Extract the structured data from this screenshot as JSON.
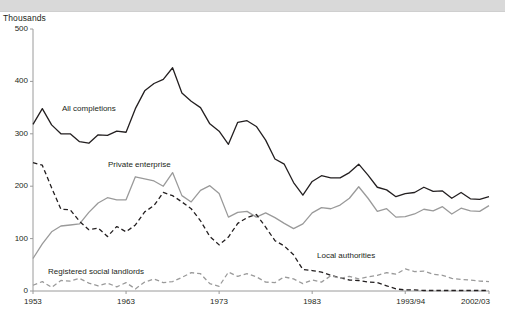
{
  "header": {
    "title": ""
  },
  "axis": {
    "unit_label": "Thousands",
    "y_ticks": [
      "500",
      "400",
      "300",
      "200",
      "100",
      "0"
    ],
    "x_ticks": [
      "1953",
      "1963",
      "1973",
      "1983",
      "1993/94",
      "2002/03"
    ]
  },
  "labels": {
    "all_completions": "All completions",
    "private_enterprise": "Private enterprise",
    "local_authorities": "Local authorities",
    "registered_social_landlords": "Registered social landlords"
  },
  "colors": {
    "all_completions": "#231f20",
    "private_enterprise": "#9a9a9a",
    "local_authorities": "#231f20",
    "registered_social_landlords": "#9a9a9a",
    "axis": "#9a9a9a",
    "header_bar": "#d9d9d9"
  },
  "chart_data": {
    "type": "line",
    "title": "",
    "xlabel": "",
    "ylabel": "Thousands",
    "ylim": [
      0,
      500
    ],
    "xlim": [
      1953,
      2002
    ],
    "grid": false,
    "legend": "inline-annotations",
    "x": [
      1953,
      1954,
      1955,
      1956,
      1957,
      1958,
      1959,
      1960,
      1961,
      1962,
      1963,
      1964,
      1965,
      1966,
      1967,
      1968,
      1969,
      1970,
      1971,
      1972,
      1973,
      1974,
      1975,
      1976,
      1977,
      1978,
      1979,
      1980,
      1981,
      1982,
      1983,
      1984,
      1985,
      1986,
      1987,
      1988,
      1989,
      1990,
      1991,
      1992,
      1993,
      1994,
      1995,
      1996,
      1997,
      1998,
      1999,
      2000,
      2001,
      2002
    ],
    "x_tick_labels": {
      "1953": "1953",
      "1963": "1963",
      "1973": "1973",
      "1983": "1983",
      "1993": "1993/94",
      "2002": "2002/03"
    },
    "series": [
      {
        "name": "All completions",
        "style": "solid",
        "color": "#231f20",
        "values": [
          318,
          348,
          317,
          300,
          300,
          285,
          282,
          298,
          297,
          305,
          303,
          348,
          382,
          396,
          404,
          426,
          378,
          362,
          350,
          319,
          305,
          280,
          322,
          325,
          314,
          288,
          252,
          242,
          207,
          183,
          209,
          220,
          216,
          216,
          226,
          242,
          221,
          198,
          193,
          180,
          186,
          188,
          198,
          190,
          191,
          177,
          188,
          176,
          175,
          180
        ]
      },
      {
        "name": "Private enterprise",
        "style": "solid",
        "color": "#9a9a9a",
        "values": [
          62,
          90,
          113,
          124,
          126,
          128,
          150,
          168,
          178,
          174,
          174,
          218,
          214,
          210,
          200,
          226,
          182,
          170,
          192,
          201,
          186,
          141,
          150,
          152,
          141,
          149,
          140,
          129,
          119,
          128,
          149,
          159,
          157,
          164,
          177,
          199,
          177,
          152,
          157,
          141,
          142,
          147,
          156,
          153,
          161,
          147,
          158,
          153,
          152,
          163
        ]
      },
      {
        "name": "Local authorities",
        "style": "dashed",
        "color": "#231f20",
        "values": [
          245,
          240,
          197,
          156,
          155,
          133,
          117,
          120,
          104,
          123,
          113,
          126,
          151,
          163,
          188,
          182,
          170,
          157,
          134,
          104,
          88,
          103,
          129,
          140,
          146,
          122,
          96,
          86,
          69,
          41,
          39,
          36,
          30,
          25,
          21,
          20,
          17,
          16,
          10,
          4,
          2,
          2,
          1,
          1,
          1,
          1,
          1,
          1,
          1,
          1
        ]
      },
      {
        "name": "Registered social landlords",
        "style": "dashed",
        "color": "#9a9a9a",
        "values": [
          11,
          18,
          7,
          20,
          19,
          24,
          15,
          10,
          15,
          8,
          16,
          4,
          17,
          23,
          16,
          18,
          26,
          35,
          33,
          14,
          9,
          36,
          28,
          33,
          27,
          17,
          16,
          27,
          23,
          14,
          21,
          17,
          29,
          24,
          28,
          23,
          27,
          30,
          35,
          32,
          42,
          37,
          38,
          32,
          30,
          24,
          22,
          21,
          19,
          18
        ]
      }
    ]
  }
}
